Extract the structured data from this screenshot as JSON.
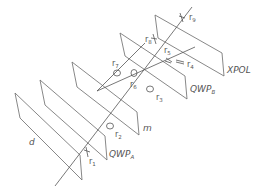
{
  "planes": [
    {
      "id": "d",
      "label": "d",
      "sub": ""
    },
    {
      "id": "qwpa",
      "label": "QWP",
      "sub": "A"
    },
    {
      "id": "m",
      "label": "m",
      "sub": ""
    },
    {
      "id": "qwpb",
      "label": "QWP",
      "sub": "B"
    },
    {
      "id": "xpol",
      "label": "XPOL",
      "sub": ""
    }
  ],
  "rays": [
    {
      "label": "r",
      "sub": "1"
    },
    {
      "label": "r",
      "sub": "2"
    },
    {
      "label": "r",
      "sub": "3"
    },
    {
      "label": "r",
      "sub": "4"
    },
    {
      "label": "r",
      "sub": "5"
    },
    {
      "label": "r",
      "sub": "6"
    },
    {
      "label": "r",
      "sub": "7"
    },
    {
      "label": "r",
      "sub": "8"
    },
    {
      "label": "r",
      "sub": "9"
    }
  ]
}
